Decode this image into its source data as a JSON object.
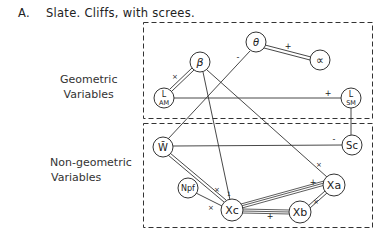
{
  "title": {
    "letter": "A.",
    "text": "Slate. Cliffs, with screes."
  },
  "groups": {
    "geometric": {
      "line1": "Geometric",
      "line2": "Variables"
    },
    "non_geometric": {
      "line1": "Non-geometric",
      "line2": "Variables"
    }
  },
  "nodes": {
    "beta": "β",
    "theta": "θ",
    "alpha": "∝",
    "l_am_top": "L",
    "l_am_sub": "AM",
    "l_sm_top": "L",
    "l_sm_sub": "SM",
    "w": "W̄",
    "sc": "Sc",
    "npf": "Npf",
    "xc": "Xc",
    "xb": "Xb",
    "xa": "Xa"
  },
  "edges": [
    {
      "from": "theta",
      "to": "alpha",
      "sign": "+",
      "style": "double"
    },
    {
      "from": "theta",
      "to": "w",
      "sign": "-",
      "style": "single"
    },
    {
      "from": "beta",
      "to": "l_am",
      "sign": "×",
      "style": "double"
    },
    {
      "from": "beta",
      "to": "xc",
      "sign": "",
      "style": "single"
    },
    {
      "from": "beta",
      "to": "xa",
      "sign": "",
      "style": "single"
    },
    {
      "from": "l_am",
      "to": "l_sm",
      "sign": "+",
      "style": "single"
    },
    {
      "from": "l_sm",
      "to": "sc",
      "sign": "",
      "style": "single"
    },
    {
      "from": "w",
      "to": "sc",
      "sign": "-",
      "style": "single"
    },
    {
      "from": "w",
      "to": "xc",
      "sign": "×",
      "style": "double"
    },
    {
      "from": "npf",
      "to": "xc",
      "sign": "×",
      "style": "single"
    },
    {
      "from": "xc",
      "to": "xa",
      "sign": "+",
      "style": "triple"
    },
    {
      "from": "xc",
      "to": "xb",
      "sign": "+",
      "style": "triple"
    },
    {
      "from": "xb",
      "to": "xa",
      "sign": "×",
      "style": "double"
    },
    {
      "from": "xa",
      "to": "beta",
      "sign": "×",
      "style": "single"
    }
  ],
  "signs": {
    "theta_alpha": "+",
    "theta_w": "-",
    "beta_lam": "×",
    "lam_lsm": "+",
    "w_sc": "-",
    "w_xc": "×",
    "npf_xc": "×",
    "beta_xc": "1",
    "xc_xb": "+",
    "xc_xa": "+",
    "xb_xa": "×",
    "beta_xa": "×"
  }
}
